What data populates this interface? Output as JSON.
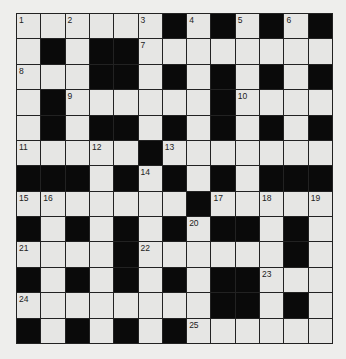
{
  "puzzle": {
    "type": "crossword",
    "rows": 13,
    "cols": 13,
    "colors": {
      "white_cell": "#e6e6e4",
      "black_cell": "#0a0a0a",
      "background": "#eeeeec",
      "line": "#222222"
    },
    "grid": [
      [
        "1",
        "W",
        "2",
        "W",
        "W",
        "3",
        "B",
        "4",
        "B",
        "5",
        "B",
        "6",
        "B"
      ],
      [
        "W",
        "B",
        "W",
        "B",
        "B",
        "7",
        "W",
        "W",
        "W",
        "W",
        "W",
        "W",
        "W"
      ],
      [
        "8",
        "W",
        "W",
        "B",
        "B",
        "W",
        "B",
        "W",
        "B",
        "W",
        "B",
        "W",
        "B"
      ],
      [
        "W",
        "B",
        "9",
        "W",
        "W",
        "W",
        "W",
        "W",
        "B",
        "10",
        "W",
        "W",
        "W"
      ],
      [
        "W",
        "B",
        "W",
        "B",
        "B",
        "W",
        "B",
        "W",
        "B",
        "W",
        "B",
        "W",
        "B"
      ],
      [
        "11",
        "W",
        "W",
        "12",
        "W",
        "B",
        "13",
        "W",
        "W",
        "W",
        "W",
        "W",
        "W"
      ],
      [
        "B",
        "B",
        "B",
        "W",
        "B",
        "14",
        "B",
        "W",
        "B",
        "W",
        "B",
        "B",
        "B"
      ],
      [
        "15",
        "16",
        "W",
        "W",
        "W",
        "W",
        "W",
        "B",
        "17",
        "W",
        "18",
        "W",
        "19"
      ],
      [
        "B",
        "W",
        "B",
        "W",
        "B",
        "W",
        "B",
        "20",
        "B",
        "B",
        "W",
        "B",
        "W"
      ],
      [
        "21",
        "W",
        "W",
        "W",
        "B",
        "22",
        "W",
        "W",
        "W",
        "W",
        "W",
        "B",
        "W"
      ],
      [
        "B",
        "W",
        "B",
        "W",
        "B",
        "W",
        "B",
        "W",
        "B",
        "B",
        "23",
        "W",
        "W"
      ],
      [
        "24",
        "W",
        "W",
        "W",
        "W",
        "W",
        "W",
        "W",
        "B",
        "B",
        "W",
        "B",
        "W"
      ],
      [
        "B",
        "W",
        "B",
        "W",
        "B",
        "W",
        "B",
        "25",
        "W",
        "W",
        "W",
        "W",
        "W"
      ]
    ]
  }
}
